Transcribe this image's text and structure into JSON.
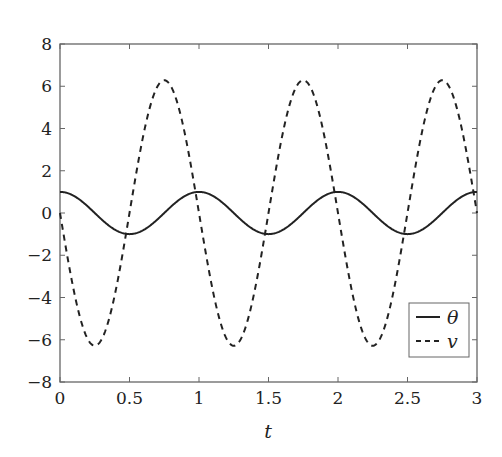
{
  "chart_data": {
    "type": "line",
    "title": "",
    "xlabel": "t",
    "ylabel": "",
    "xlim": [
      0,
      3
    ],
    "ylim": [
      -8,
      8
    ],
    "grid": false,
    "legend_position": "lower right",
    "xticks": [
      0,
      0.5,
      1,
      1.5,
      2,
      2.5,
      3
    ],
    "xtick_labels": [
      "0",
      "0.5",
      "1",
      "1.5",
      "2",
      "2.5",
      "3"
    ],
    "yticks": [
      8,
      6,
      4,
      2,
      0,
      -2,
      -4,
      -6,
      -8
    ],
    "ytick_labels": [
      "8",
      "6",
      "4",
      "2",
      "0",
      "−2",
      "−4",
      "−6",
      "−8"
    ],
    "x": [
      0,
      0.125,
      0.25,
      0.375,
      0.5,
      0.625,
      0.75,
      0.875,
      1,
      1.125,
      1.25,
      1.375,
      1.5,
      1.625,
      1.75,
      1.875,
      2,
      2.125,
      2.25,
      2.375,
      2.5,
      2.625,
      2.75,
      2.875,
      3
    ],
    "series": [
      {
        "name": "θ",
        "style": "solid",
        "formula": "cos(2*pi*t)",
        "values": [
          1,
          0.707,
          0,
          -0.707,
          -1,
          -0.707,
          0,
          0.707,
          1,
          0.707,
          0,
          -0.707,
          -1,
          -0.707,
          0,
          0.707,
          1,
          0.707,
          0,
          -0.707,
          -1,
          -0.707,
          0,
          0.707,
          1
        ]
      },
      {
        "name": "v",
        "style": "dashed",
        "formula": "-2*pi*sin(2*pi*t)",
        "values": [
          0,
          -4.44,
          -6.28,
          -4.44,
          0,
          4.44,
          6.28,
          4.44,
          0,
          -4.44,
          -6.28,
          -4.44,
          0,
          4.44,
          6.28,
          4.44,
          0,
          -4.44,
          -6.28,
          -4.44,
          0,
          4.44,
          6.28,
          4.44,
          0
        ]
      }
    ]
  },
  "legend": {
    "items": [
      {
        "label": "θ",
        "style": "solid"
      },
      {
        "label": "v",
        "style": "dashed"
      }
    ]
  },
  "colors": {
    "axis": "#555555",
    "line": "#222222"
  }
}
